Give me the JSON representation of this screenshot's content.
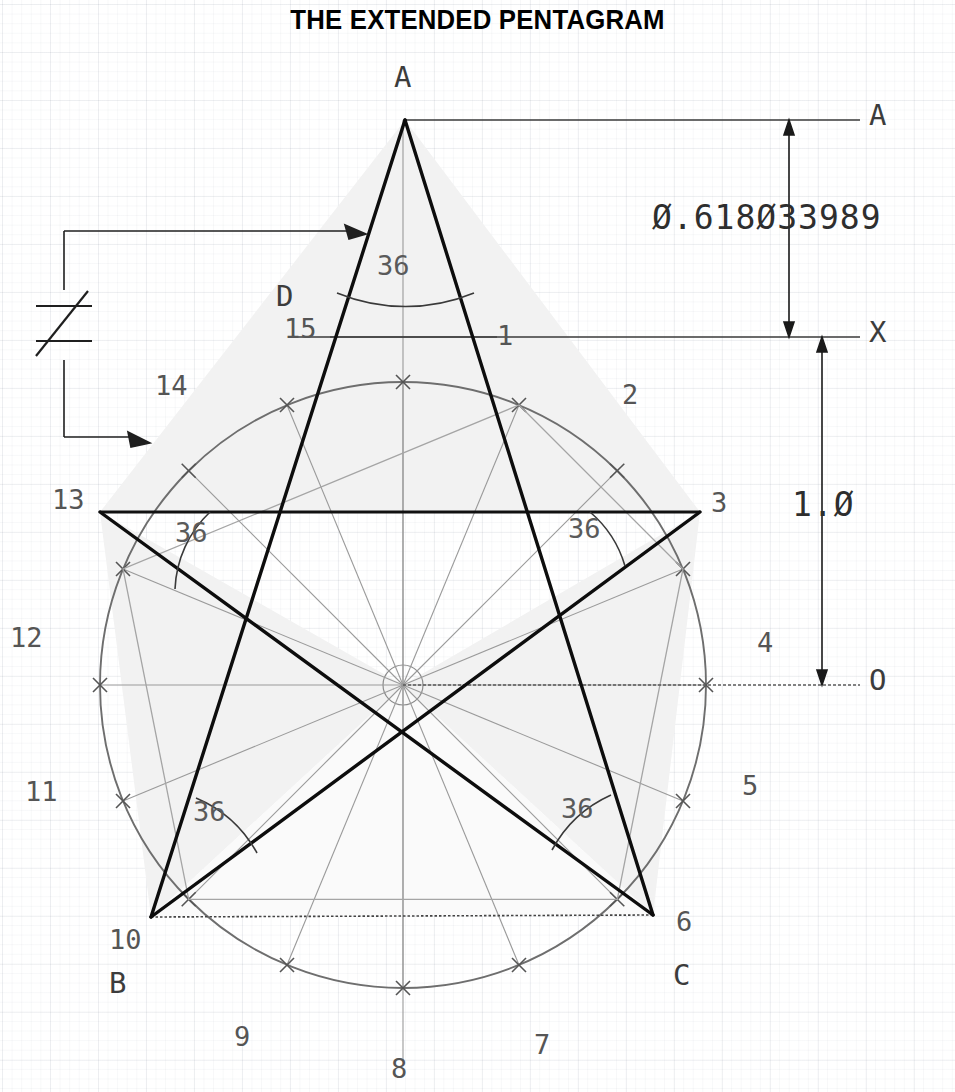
{
  "page": {
    "title": "THE EXTENDED PENTAGRAM",
    "background": "#ffffff",
    "ink_dark": "#111111",
    "ink_mid": "#4a4a4a",
    "ink_light": "#8a8a8a",
    "fill_shade": "#f1f1f1"
  },
  "dimensions": {
    "upper": "Ø.618Ø33989",
    "lower": "1.Ø",
    "upper_top_label": "A",
    "upper_bottom_label": "X",
    "lower_bottom_label": "O"
  },
  "compare": {
    "symbol": "≠"
  },
  "vertices": [
    {
      "name": "apex-A",
      "label": "A",
      "x": 405,
      "y": 78
    },
    {
      "name": "vertex-B",
      "label": "B",
      "x": 118,
      "y": 985
    },
    {
      "name": "vertex-C",
      "label": "C",
      "x": 682,
      "y": 978
    },
    {
      "name": "vertex-D",
      "label": "D",
      "x": 288,
      "y": 298
    }
  ],
  "ticks": [
    {
      "n": "1",
      "x": 497,
      "y": 337
    },
    {
      "n": "2",
      "x": 622,
      "y": 397
    },
    {
      "n": "3",
      "x": 722,
      "y": 505
    },
    {
      "n": "4",
      "x": 766,
      "y": 646
    },
    {
      "n": "5",
      "x": 750,
      "y": 788
    },
    {
      "n": "6",
      "x": 683,
      "y": 928
    },
    {
      "n": "7",
      "x": 541,
      "y": 1048
    },
    {
      "n": "8",
      "x": 397,
      "y": 1072
    },
    {
      "n": "9",
      "x": 241,
      "y": 1040
    },
    {
      "n": "10",
      "x": 121,
      "y": 943
    },
    {
      "n": "11",
      "x": 33,
      "y": 795
    },
    {
      "n": "12",
      "x": 18,
      "y": 641
    },
    {
      "n": "13",
      "x": 60,
      "y": 503
    },
    {
      "n": "14",
      "x": 163,
      "y": 389
    },
    {
      "n": "15",
      "x": 292,
      "y": 332
    }
  ],
  "angles": [
    {
      "name": "apex-angle",
      "value": "36",
      "x": 377,
      "y": 265
    },
    {
      "name": "left-upper-angle",
      "value": "36",
      "x": 175,
      "y": 532
    },
    {
      "name": "right-upper-angle",
      "value": "36",
      "x": 568,
      "y": 528
    },
    {
      "name": "left-lower-angle",
      "value": "36",
      "x": 193,
      "y": 811
    },
    {
      "name": "right-lower-angle",
      "value": "36",
      "x": 561,
      "y": 808
    }
  ],
  "geometry": {
    "center": {
      "x": 403,
      "y": 685
    },
    "radius": 303,
    "divisions": 16,
    "star_tick_indices": [
      1,
      3,
      6,
      10,
      13
    ],
    "apex": {
      "x": 405,
      "y": 120
    },
    "x_line_y": 337,
    "a_line_y": 120,
    "o_line_y": 685,
    "dim_arrow_x": 789
  }
}
